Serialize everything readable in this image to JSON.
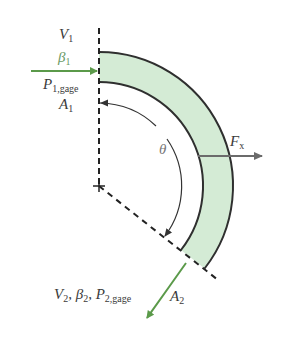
{
  "diagram": {
    "colors": {
      "pipe_fill": "#d4ebd5",
      "pipe_wall": "#2f2f2f",
      "flow_arrow": "#5b9a4a",
      "force_arrow": "#6b6b6b",
      "dashed_line": "#222222"
    },
    "inlet": {
      "velocity": {
        "symbol": "V",
        "sub": "1"
      },
      "momentum_factor": {
        "symbol": "β",
        "sub": "1"
      },
      "pressure": {
        "symbol": "P",
        "sub": "1,gage"
      },
      "area": {
        "symbol": "A",
        "sub": "1"
      }
    },
    "outlet": {
      "velocity": {
        "symbol": "V",
        "sub": "2"
      },
      "momentum_factor": {
        "symbol": "β",
        "sub": "2"
      },
      "pressure": {
        "symbol": "P",
        "sub": "2,gage"
      },
      "area": {
        "symbol": "A",
        "sub": "2"
      },
      "sep": ", "
    },
    "angle_label": "θ",
    "force": {
      "symbol": "F",
      "sub": "x"
    }
  }
}
